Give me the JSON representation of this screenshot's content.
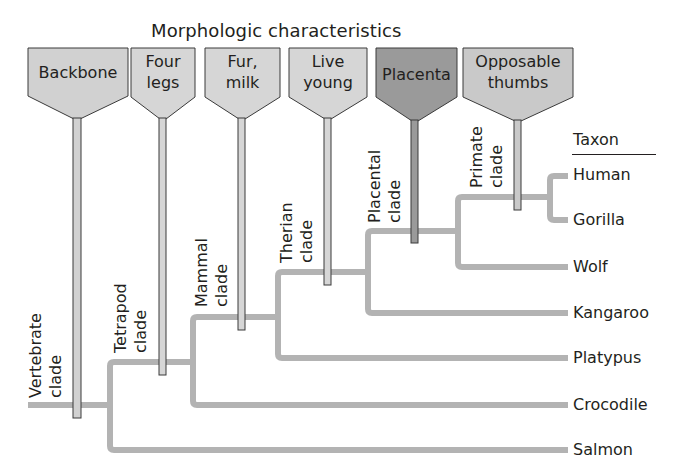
{
  "title": "Morphologic characteristics",
  "characteristics": [
    {
      "label_line1": "Backbone",
      "label_line2": "",
      "fill": "#d1d1d1",
      "stem_x": 77,
      "stem_bottom": 418
    },
    {
      "label_line1": "Four",
      "label_line2": "legs",
      "fill": "#d6d6d6",
      "stem_x": 162,
      "stem_bottom": 375
    },
    {
      "label_line1": "Fur,",
      "label_line2": "milk",
      "fill": "#d6d6d6",
      "stem_x": 241,
      "stem_bottom": 330
    },
    {
      "label_line1": "Live",
      "label_line2": "young",
      "fill": "#d6d6d6",
      "stem_x": 327,
      "stem_bottom": 285
    },
    {
      "label_line1": "Placenta",
      "label_line2": "",
      "fill": "#9a9a9a",
      "stem_x": 414,
      "stem_bottom": 243
    },
    {
      "label_line1": "Opposable",
      "label_line2": "thumbs",
      "fill": "#c9c9c9",
      "stem_x": 517,
      "stem_bottom": 210
    }
  ],
  "clades": [
    {
      "line1": "Vertebrate",
      "line2": "clade"
    },
    {
      "line1": "Tetrapod",
      "line2": "clade"
    },
    {
      "line1": "Mammal",
      "line2": "clade"
    },
    {
      "line1": "Therian",
      "line2": "clade"
    },
    {
      "line1": "Placental",
      "line2": "clade"
    },
    {
      "line1": "Primate",
      "line2": "clade"
    }
  ],
  "taxon_header": "Taxon",
  "taxa": [
    "Human",
    "Gorilla",
    "Wolf",
    "Kangaroo",
    "Platypus",
    "Crocodile",
    "Salmon"
  ],
  "colors": {
    "branch": "#b3b3b3",
    "outline": "#3a3a3a",
    "text": "#231f20",
    "placenta_fill": "#9a9a9a",
    "shield_fill": "#d6d6d6"
  }
}
